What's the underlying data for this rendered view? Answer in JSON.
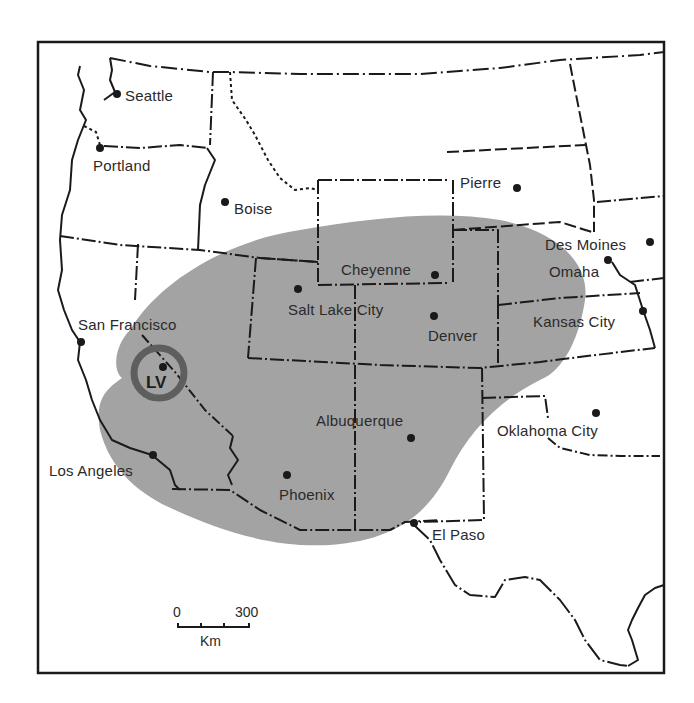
{
  "map": {
    "type": "regional map of the western United States",
    "shaded_region_color": "#9a9a9a",
    "marker_ring_color": "#5e5e5e",
    "line_color": "#1a1a1a",
    "background": "#ffffff"
  },
  "cities": [
    {
      "name": "Seattle",
      "x": 117,
      "y": 94
    },
    {
      "name": "Portland",
      "x": 100,
      "y": 147
    },
    {
      "name": "Boise",
      "x": 225,
      "y": 202
    },
    {
      "name": "Pierre",
      "x": 517,
      "y": 188
    },
    {
      "name": "Des Moines",
      "x": 650,
      "y": 242
    },
    {
      "name": "Omaha",
      "x": 608,
      "y": 260
    },
    {
      "name": "Cheyenne",
      "x": 435,
      "y": 275
    },
    {
      "name": "Salt Lake City",
      "x": 298,
      "y": 289
    },
    {
      "name": "Denver",
      "x": 434,
      "y": 316
    },
    {
      "name": "Kansas City",
      "x": 643,
      "y": 310
    },
    {
      "name": "San Francisco",
      "x": 81,
      "y": 342
    },
    {
      "name": "Albuquerque",
      "x": 411,
      "y": 438
    },
    {
      "name": "Oklahoma City",
      "x": 596,
      "y": 413
    },
    {
      "name": "Los Angeles",
      "x": 153,
      "y": 455
    },
    {
      "name": "Phoenix",
      "x": 287,
      "y": 475
    },
    {
      "name": "El Paso",
      "x": 414,
      "y": 523
    }
  ],
  "labels": {
    "seattle": "Seattle",
    "portland": "Portland",
    "boise": "Boise",
    "pierre": "Pierre",
    "des_moines": "Des Moines",
    "omaha": "Omaha",
    "cheyenne": "Cheyenne",
    "salt_lake_city": "Salt Lake City",
    "denver": "Denver",
    "kansas_city": "Kansas City",
    "san_francisco": "San Francisco",
    "albuquerque": "Albuquerque",
    "oklahoma_city": "Oklahoma City",
    "los_angeles": "Los Angeles",
    "phoenix": "Phoenix",
    "el_paso": "El Paso"
  },
  "highlight": {
    "label": "LV"
  },
  "scale_bar": {
    "start": "0",
    "end": "300",
    "unit": "Km"
  }
}
